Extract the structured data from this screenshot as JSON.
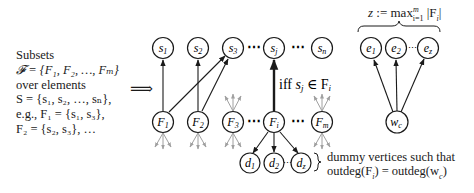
{
  "left_text": {
    "lines": [
      "Subsets",
      "𝓕 = {F₁, F₂, …, Fₘ}",
      "over elements",
      "S = {s₁, s₂, …, sₙ},",
      "e.g., F₁ = {s₁, s₃},",
      "F₂ = {s₂, s₃}, …"
    ]
  },
  "implies_symbol": "⟹",
  "element_nodes": [
    {
      "id": "s1",
      "label": "s",
      "sub": "1"
    },
    {
      "id": "s2",
      "label": "s",
      "sub": "2"
    },
    {
      "id": "s3",
      "label": "s",
      "sub": "3"
    },
    {
      "id": "sj",
      "label": "s",
      "sub": "j"
    },
    {
      "id": "sn",
      "label": "s",
      "sub": "n"
    }
  ],
  "set_nodes": [
    {
      "id": "F1",
      "label": "F",
      "sub": "1"
    },
    {
      "id": "F2",
      "label": "F",
      "sub": "2"
    },
    {
      "id": "F3",
      "label": "F",
      "sub": "3"
    },
    {
      "id": "Fi",
      "label": "F",
      "sub": "i"
    },
    {
      "id": "Fm",
      "label": "F",
      "sub": "m"
    }
  ],
  "dummy_nodes": [
    {
      "id": "d1",
      "label": "d",
      "sub": "1"
    },
    {
      "id": "d2",
      "label": "d",
      "sub": "2"
    },
    {
      "id": "dz",
      "label": "d",
      "sub": "z"
    }
  ],
  "extra_nodes": [
    {
      "id": "e1",
      "label": "e",
      "sub": "1"
    },
    {
      "id": "e2",
      "label": "e",
      "sub": "2"
    },
    {
      "id": "ez",
      "label": "e",
      "sub": "z"
    }
  ],
  "center_node": {
    "id": "wc",
    "label": "w",
    "sub": "c"
  },
  "ellipsis": "⋯",
  "edge_label": {
    "prefix": "iff ",
    "math": "s",
    "sub": "j",
    "rest": " ∈ F",
    "sub2": "i"
  },
  "top_brace_label": "z := max",
  "top_brace_sup": "m",
  "top_brace_sub": "i=1",
  "top_brace_tail": " |F",
  "top_brace_tail_sub": "i",
  "top_brace_end": "|",
  "dummy_note": {
    "line1": "dummy vertices such that",
    "line2": "outdeg(F",
    "line2_sub": "i",
    "line2_mid": ") = outdeg(w",
    "line2_sub2": "c",
    "line2_end": ")"
  },
  "colors": {
    "stroke": "#1a1a1a",
    "faded": "#a0a0a0"
  }
}
